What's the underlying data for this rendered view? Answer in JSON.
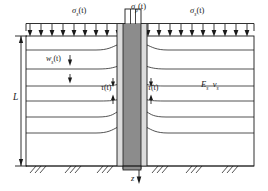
{
  "figure": {
    "type": "engineering-schematic",
    "labels": {
      "stress_soil_left": {
        "symbol": "σ",
        "sub": "s",
        "arg": "(t)",
        "text": "σs(t)"
      },
      "stress_soil_right": {
        "symbol": "σ",
        "sub": "s",
        "arg": "(t)",
        "text": "σs(t)"
      },
      "stress_pile": {
        "symbol": "σ",
        "sub": "p",
        "arg": "(t)",
        "text": "σp(t)"
      },
      "settlement_soil": {
        "symbol": "w",
        "sub": "s",
        "arg": "(t)",
        "text": "ws(t)"
      },
      "shear_left": {
        "symbol": "τ",
        "sub": "",
        "arg": "(t)",
        "text": "τ(t)"
      },
      "shear_right": {
        "symbol": "τ",
        "sub": "",
        "arg": "(t)",
        "text": "τ(t)"
      },
      "soil_modulus": {
        "symbol": "E",
        "sub": "s",
        "text": "Es"
      },
      "soil_poisson": {
        "symbol": "v",
        "sub": "s",
        "text": "vs"
      },
      "pile_length": {
        "symbol": "L",
        "text": "L"
      },
      "depth_axis": {
        "symbol": "z",
        "text": "z"
      }
    },
    "geometry": {
      "surface_load_arrow_count": 21,
      "soil_layer_line_count": 6,
      "base_hatch_count": 12,
      "pile_top_y": 24,
      "pile_bottom_y": 166,
      "pile_left_x": 117,
      "pile_right_x": 147
    },
    "colors": {
      "line": "#1a1a1a",
      "pile_core": "#8c8c8c",
      "pile_shell": "#d9d9d9",
      "soil_fill": "#ffffff",
      "background": "#ffffff"
    }
  }
}
